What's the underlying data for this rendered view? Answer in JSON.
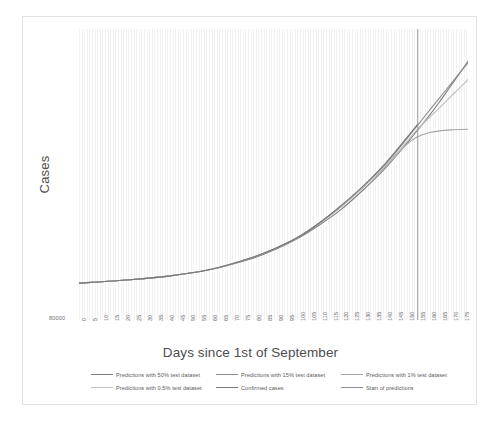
{
  "chart_data": {
    "type": "line",
    "title": "",
    "xlabel": "Days since 1st of September",
    "ylabel": "Cases",
    "xlim": [
      0,
      178
    ],
    "ylim": [
      80000,
      230000
    ],
    "grid": "vertical-minor",
    "legend_position": "bottom",
    "y_tick_labels": [
      "80000"
    ],
    "x_tick_labels": [
      "0",
      "5",
      "10",
      "15",
      "20",
      "25",
      "30",
      "35",
      "40",
      "45",
      "50",
      "55",
      "60",
      "65",
      "70",
      "75",
      "80",
      "85",
      "90",
      "95",
      "100",
      "105",
      "110",
      "115",
      "120",
      "125",
      "130",
      "135",
      "140",
      "145",
      "150",
      "155",
      "160",
      "165",
      "170",
      "175"
    ],
    "x_tick_values": [
      0,
      5,
      10,
      15,
      20,
      25,
      30,
      35,
      40,
      45,
      50,
      55,
      60,
      65,
      70,
      75,
      80,
      85,
      90,
      95,
      100,
      105,
      110,
      115,
      120,
      125,
      130,
      135,
      140,
      145,
      150,
      155,
      160,
      165,
      170,
      175
    ],
    "annotations": [
      {
        "name": "start-of-predictions",
        "type": "vline",
        "x": 155,
        "color": "#808080"
      }
    ],
    "series": [
      {
        "name": "Predictions with 50% test dataset",
        "color": "#7f7f7f",
        "x": [
          0,
          20,
          40,
          60,
          80,
          90,
          100,
          110,
          120,
          130,
          140,
          150,
          155,
          160,
          165,
          170,
          175,
          178
        ],
        "y": [
          99000,
          100500,
          102500,
          106000,
          112000,
          116500,
          122000,
          129000,
          137000,
          147000,
          158000,
          171000,
          178000,
          185000,
          192500,
          200500,
          208500,
          213500
        ]
      },
      {
        "name": "Predictions with 15% test dataset",
        "color": "#8c8c8c",
        "x": [
          0,
          20,
          40,
          60,
          80,
          90,
          100,
          110,
          120,
          130,
          140,
          150,
          155,
          160,
          165,
          170,
          175,
          178
        ],
        "y": [
          99000,
          100500,
          102500,
          106000,
          112500,
          117000,
          122500,
          130000,
          138500,
          148500,
          160000,
          173500,
          180500,
          187500,
          194500,
          201500,
          208500,
          212500
        ]
      },
      {
        "name": "Predictions with 1% test dataset",
        "color": "#a6a6a6",
        "x": [
          0,
          20,
          40,
          60,
          80,
          90,
          100,
          110,
          120,
          130,
          140,
          150,
          155,
          160,
          165,
          170,
          175,
          178
        ],
        "y": [
          99000,
          100500,
          102500,
          106000,
          112500,
          117000,
          122500,
          130000,
          138500,
          148500,
          159000,
          170500,
          174500,
          176500,
          177500,
          178000,
          178200,
          178300
        ]
      },
      {
        "name": "Predictions with 0.5% test dataset",
        "color": "#bfbfbf",
        "x": [
          0,
          20,
          40,
          60,
          80,
          90,
          100,
          110,
          120,
          130,
          140,
          150,
          155,
          160,
          165,
          170,
          175,
          178
        ],
        "y": [
          99000,
          100500,
          102500,
          106000,
          112500,
          117000,
          122500,
          130000,
          138500,
          148500,
          159500,
          172000,
          178500,
          184000,
          189500,
          195000,
          200500,
          204000
        ]
      },
      {
        "name": "Confirmed cases",
        "color": "#767676",
        "x": [
          0,
          20,
          40,
          60,
          80,
          90,
          100,
          110,
          120,
          130,
          140,
          150,
          155
        ],
        "y": [
          99000,
          100500,
          102500,
          106000,
          112500,
          117000,
          122500,
          130000,
          139000,
          149000,
          160500,
          174000,
          181000
        ]
      },
      {
        "name": "Start of predictions",
        "color": "#8c8c8c",
        "x": [
          155,
          155
        ],
        "y": [
          80000,
          230000
        ]
      }
    ]
  },
  "axes": {
    "y_title": "Cases",
    "x_title": "Days since 1st of September",
    "y_tick_0": "80000"
  },
  "legend": {
    "items": [
      {
        "label": "Predictions with 50% test dataset",
        "color": "#7f7f7f",
        "row": 0,
        "col": 0
      },
      {
        "label": "Predictions with 15% test dataset",
        "color": "#8c8c8c",
        "row": 0,
        "col": 1
      },
      {
        "label": "Predictions with 1% test dataset",
        "color": "#a6a6a6",
        "row": 0,
        "col": 2
      },
      {
        "label": "Predictions with 0.5% test dataset",
        "color": "#bfbfbf",
        "row": 1,
        "col": 0
      },
      {
        "label": "Confirmed cases",
        "color": "#767676",
        "row": 1,
        "col": 1
      },
      {
        "label": "Start of predictions",
        "color": "#8c8c8c",
        "row": 1,
        "col": 2
      }
    ]
  }
}
